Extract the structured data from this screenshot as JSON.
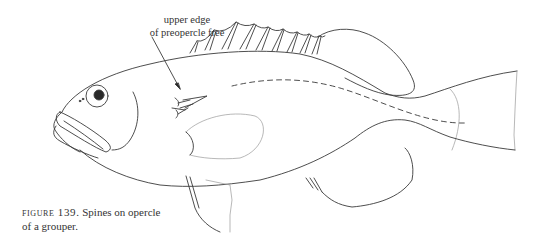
{
  "figure": {
    "subject": "grouper",
    "annotation": {
      "line1": "upper edge",
      "line2": "of preopercle free"
    },
    "caption": {
      "label": "figure 139.",
      "text_line1": " Spines on opercle",
      "text_line2": "of a grouper."
    },
    "colors": {
      "line": "#3a3a3a",
      "light_line": "#9a9a9a",
      "background": "#ffffff"
    }
  }
}
